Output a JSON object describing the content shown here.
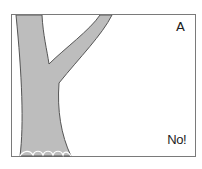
{
  "figure": {
    "panel_label": "A",
    "caption_text": "No!",
    "trunk_color": "#bdbdbd",
    "outline_color": "#555555",
    "frame_color": "#7a7a7a"
  }
}
